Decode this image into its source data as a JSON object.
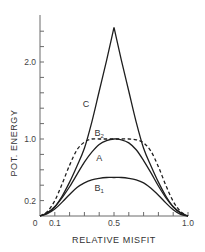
{
  "chart_data": {
    "type": "line",
    "title": "",
    "xlabel": "RELATIVE MISFIT",
    "ylabel": "POT. ENERGY",
    "xlim": [
      0,
      1.0
    ],
    "ylim": [
      0,
      2.6
    ],
    "grid": false,
    "legend": "inline curve labels",
    "x_tick_labels": [
      {
        "value": 0,
        "label": "0"
      },
      {
        "value": 0.1,
        "label": "0.1"
      },
      {
        "value": 0.5,
        "label": "0.5"
      },
      {
        "value": 1.0,
        "label": "1.0"
      }
    ],
    "x_minor_ticks": [
      0.1,
      0.2,
      0.3,
      0.4,
      0.5,
      0.6,
      0.7,
      0.8,
      0.9,
      1.0
    ],
    "y_tick_labels": [
      {
        "value": 0.2,
        "label": "0.2"
      },
      {
        "value": 1.0,
        "label": "1.0"
      },
      {
        "value": 2.0,
        "label": "2.0"
      }
    ],
    "y_minor_ticks": [
      0.2,
      0.4,
      0.6,
      0.8,
      1.0,
      1.2,
      1.4,
      1.6,
      1.8,
      2.0,
      2.2,
      2.4
    ],
    "series": [
      {
        "name": "C",
        "label": "C",
        "subscript": "",
        "style": "solid",
        "x": [
          0,
          0.05,
          0.1,
          0.15,
          0.2,
          0.25,
          0.3,
          0.35,
          0.4,
          0.45,
          0.5,
          0.55,
          0.6,
          0.65,
          0.7,
          0.75,
          0.8,
          0.85,
          0.9,
          0.95,
          1.0
        ],
        "values": [
          0,
          0.04,
          0.12,
          0.26,
          0.44,
          0.65,
          0.88,
          1.22,
          1.62,
          2.02,
          2.45,
          2.02,
          1.62,
          1.22,
          0.88,
          0.65,
          0.44,
          0.26,
          0.12,
          0.04,
          0
        ],
        "label_pos": [
          0.31,
          1.42
        ]
      },
      {
        "name": "B2",
        "label": "B",
        "subscript": "2",
        "style": "dashed",
        "x": [
          0,
          0.05,
          0.1,
          0.15,
          0.2,
          0.25,
          0.3,
          0.35,
          0.4,
          0.45,
          0.5,
          0.55,
          0.6,
          0.65,
          0.7,
          0.75,
          0.8,
          0.85,
          0.9,
          0.95,
          1.0
        ],
        "values": [
          0,
          0.06,
          0.2,
          0.42,
          0.66,
          0.86,
          0.96,
          1.0,
          1.0,
          1.0,
          1.0,
          1.0,
          1.0,
          0.99,
          0.95,
          0.84,
          0.64,
          0.4,
          0.19,
          0.06,
          0
        ],
        "label_pos": [
          0.4,
          1.04
        ]
      },
      {
        "name": "A",
        "label": "A",
        "subscript": "",
        "style": "solid",
        "x": [
          0,
          0.05,
          0.1,
          0.15,
          0.2,
          0.25,
          0.3,
          0.35,
          0.4,
          0.45,
          0.5,
          0.55,
          0.6,
          0.65,
          0.7,
          0.75,
          0.8,
          0.85,
          0.9,
          0.95,
          1.0
        ],
        "values": [
          0,
          0.04,
          0.12,
          0.24,
          0.38,
          0.54,
          0.7,
          0.83,
          0.93,
          0.98,
          1.0,
          0.99,
          0.95,
          0.86,
          0.72,
          0.56,
          0.39,
          0.24,
          0.12,
          0.04,
          0
        ],
        "label_pos": [
          0.4,
          0.72
        ]
      },
      {
        "name": "B1",
        "label": "B",
        "subscript": "1",
        "style": "solid",
        "x": [
          0,
          0.05,
          0.1,
          0.15,
          0.2,
          0.25,
          0.3,
          0.35,
          0.4,
          0.45,
          0.5,
          0.55,
          0.6,
          0.65,
          0.7,
          0.75,
          0.8,
          0.85,
          0.9,
          0.95,
          1.0
        ],
        "values": [
          0,
          0.03,
          0.09,
          0.18,
          0.28,
          0.37,
          0.43,
          0.47,
          0.49,
          0.5,
          0.5,
          0.5,
          0.49,
          0.47,
          0.43,
          0.36,
          0.27,
          0.17,
          0.08,
          0.02,
          0
        ],
        "label_pos": [
          0.4,
          0.32
        ]
      }
    ]
  }
}
